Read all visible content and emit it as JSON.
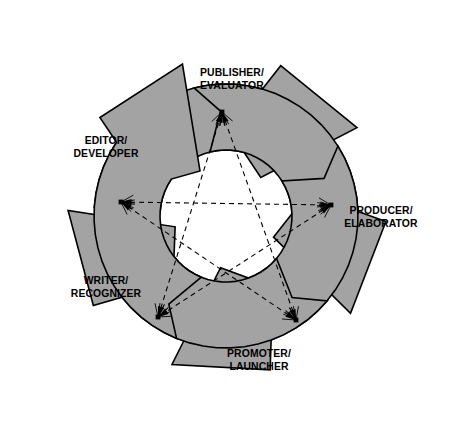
{
  "diagram": {
    "shape_fill_color": "#a3a3a3",
    "shape_outline_color": "#000000",
    "background_color": "#ffffff",
    "connector_style": "dashed double-headed arrows forming a pentagram",
    "arrow_count": 5,
    "rotation_direction": "clockwise",
    "nodes": [
      {
        "id": "publisher-evaluator",
        "line1": "PUBLISHER/",
        "line2": "EVALUATOR",
        "position": "top",
        "angle_deg": -90,
        "label_x": 232,
        "label_y": 76,
        "vertex_x": 222,
        "vertex_y": 112
      },
      {
        "id": "producer-elaborator",
        "line1": "PRODUCER/",
        "line2": "ELABORATOR",
        "position": "right",
        "angle_deg": -18,
        "label_x": 381,
        "label_y": 214,
        "vertex_x": 331,
        "vertex_y": 205
      },
      {
        "id": "promoter-launcher",
        "line1": "PROMOTER/",
        "line2": "LAUNCHER",
        "position": "bottom-right",
        "angle_deg": 54,
        "label_x": 259,
        "label_y": 357,
        "vertex_x": 296,
        "vertex_y": 320
      },
      {
        "id": "writer-recognizer",
        "line1": "WRITER/",
        "line2": "RECOGNIZER",
        "position": "bottom-left",
        "angle_deg": 126,
        "label_x": 106,
        "label_y": 284,
        "vertex_x": 158,
        "vertex_y": 317
      },
      {
        "id": "editor-developer",
        "line1": "EDITOR/",
        "line2": "DEVELOPER",
        "position": "left",
        "angle_deg": 198,
        "label_x": 106,
        "label_y": 144,
        "vertex_x": 121,
        "vertex_y": 202
      }
    ],
    "connections": [
      {
        "from": "publisher-evaluator",
        "to": "promoter-launcher",
        "bidirectional": true
      },
      {
        "from": "promoter-launcher",
        "to": "editor-developer",
        "bidirectional": true
      },
      {
        "from": "editor-developer",
        "to": "producer-elaborator",
        "bidirectional": true
      },
      {
        "from": "producer-elaborator",
        "to": "writer-recognizer",
        "bidirectional": true
      },
      {
        "from": "writer-recognizer",
        "to": "publisher-evaluator",
        "bidirectional": true
      }
    ]
  }
}
